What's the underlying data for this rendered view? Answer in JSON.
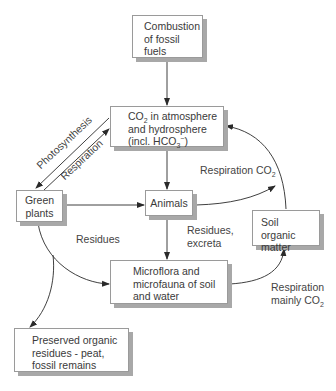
{
  "nodes": {
    "combustion": {
      "lines": [
        "Combustion",
        "of fossil",
        "fuels"
      ]
    },
    "co2": {
      "line1_pre": "CO",
      "line1_sub": "2",
      "line1_post": " in atmosphere",
      "line2": "and hydrosphere",
      "line3_pre": "(incl. HCO",
      "line3_sub": "3",
      "line3_sup": "−",
      "line3_post": ")"
    },
    "green_plants": {
      "lines": [
        "Green",
        "plants"
      ]
    },
    "animals": {
      "label": "Animals"
    },
    "soil_organic": {
      "lines": [
        "Soil organic",
        "matter"
      ]
    },
    "microflora": {
      "lines": [
        "Microflora and",
        "microfauna of soil",
        "and water"
      ]
    },
    "preserved": {
      "lines": [
        "Preserved organic",
        "residues - peat,",
        "fossil remains"
      ]
    }
  },
  "edges": {
    "photosynthesis": "Photosynthesis",
    "respiration": "Respiration",
    "respiration_co2_pre": "Respiration CO",
    "respiration_co2_sub": "2",
    "residues": "Residues",
    "residues_excreta": [
      "Residues,",
      "excreta"
    ],
    "respiration_mainly": [
      "Respiration",
      "mainly CO"
    ],
    "respiration_mainly_sub": "2"
  },
  "colors": {
    "line": "#2a2a2a",
    "border": "#9a9a9a",
    "shadow": "#a8a8a8",
    "text": "#3a3a3a"
  }
}
